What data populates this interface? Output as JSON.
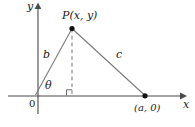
{
  "figure": {
    "kind": "geometry-diagram",
    "width": 195,
    "height": 127,
    "colors": {
      "background": "#ffffff",
      "axis": "#4a4a4a",
      "line": "#6e6e6e",
      "dashed": "#8a8a8a",
      "point": "#111111",
      "text": "#1a1a1a"
    },
    "axes": {
      "x_label": "x",
      "y_label": "y",
      "origin_label": "0",
      "x_axis": {
        "x1": 8,
        "y1": 96,
        "x2": 182,
        "y2": 96,
        "arrow": "right"
      },
      "y_axis": {
        "x1": 38,
        "y1": 114,
        "x2": 38,
        "y2": 8,
        "arrow": "up"
      }
    },
    "points": [
      {
        "name": "P",
        "label": "P(x, y)",
        "cx": 72,
        "cy": 28,
        "r": 2.6
      },
      {
        "name": "A",
        "label": "(a, 0)",
        "cx": 145,
        "cy": 96,
        "r": 2.6
      }
    ],
    "segments": [
      {
        "name": "side-b",
        "label": "b",
        "from": "origin",
        "to": "P",
        "style": "solid"
      },
      {
        "name": "side-c",
        "label": "c",
        "from": "P",
        "to": "A",
        "style": "solid"
      },
      {
        "name": "altitude",
        "label": "",
        "from": "P",
        "to": "foot",
        "style": "dashed"
      }
    ],
    "angle": {
      "name": "theta",
      "label": "θ",
      "vertex": "origin",
      "between": [
        "x-axis",
        "side-b"
      ]
    },
    "right_angle": {
      "name": "right-angle-marker",
      "at": {
        "x": 72,
        "y": 96
      },
      "size": 6
    }
  }
}
